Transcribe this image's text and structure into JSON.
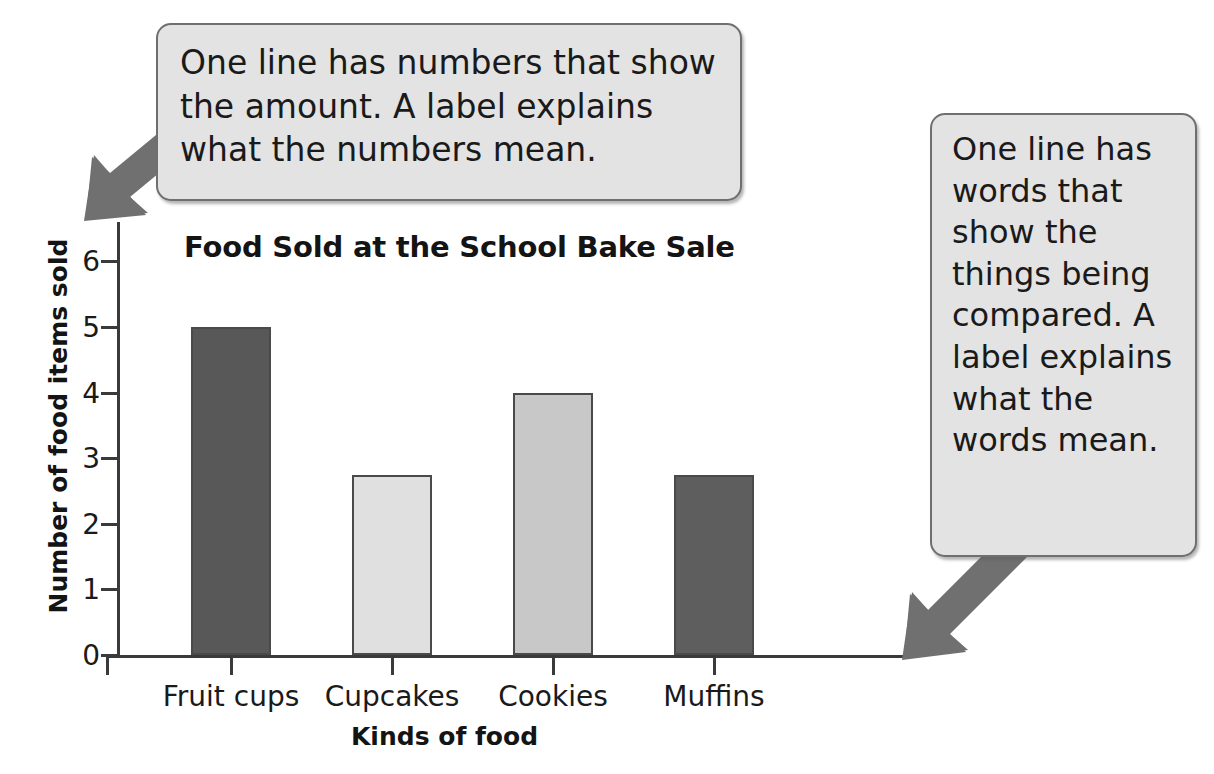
{
  "callouts": {
    "left": {
      "text": "One line has numbers that show the amount. A label explains what the numbers mean.",
      "arrow_icon": "arrow-down-left-icon"
    },
    "right": {
      "text": "One line has words that show the things being compared. A label explains what the words mean.",
      "arrow_icon": "arrow-down-left-icon"
    }
  },
  "colors": {
    "callout_fill": "#e3e3e3",
    "callout_border": "#6f6f6f",
    "arrow_fill": "#707070",
    "axis": "#3a3a3a",
    "text": "#141414"
  },
  "chart_data": {
    "type": "bar",
    "title": "Food Sold at the School Bake Sale",
    "xlabel": "Kinds of food",
    "ylabel": "Number of food items sold",
    "categories": [
      "Fruit cups",
      "Cupcakes",
      "Cookies",
      "Muffins"
    ],
    "values": [
      5,
      2.75,
      4,
      2.75
    ],
    "bar_colors": [
      "#585858",
      "#e0e0e0",
      "#c8c8c8",
      "#5e5e5e"
    ],
    "ylim": [
      0,
      6.5
    ],
    "yticks": [
      0,
      1,
      2,
      3,
      4,
      5,
      6
    ],
    "ytick_labels": [
      "0",
      "1",
      "2",
      "3",
      "4",
      "5",
      "6"
    ],
    "grid": false,
    "legend": "none"
  }
}
